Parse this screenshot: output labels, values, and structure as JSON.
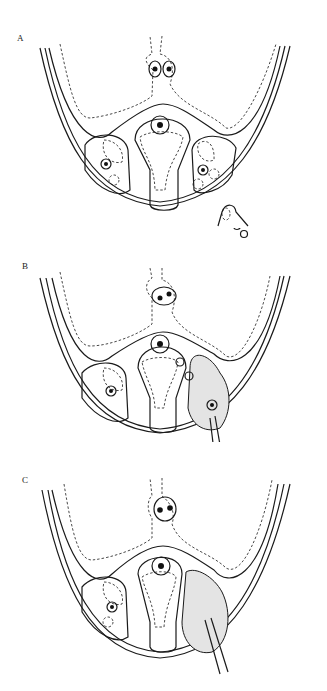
{
  "figure": {
    "panels": [
      {
        "label": "A",
        "top": 0
      },
      {
        "label": "B",
        "top": 228
      },
      {
        "label": "C",
        "top": 442
      }
    ]
  }
}
